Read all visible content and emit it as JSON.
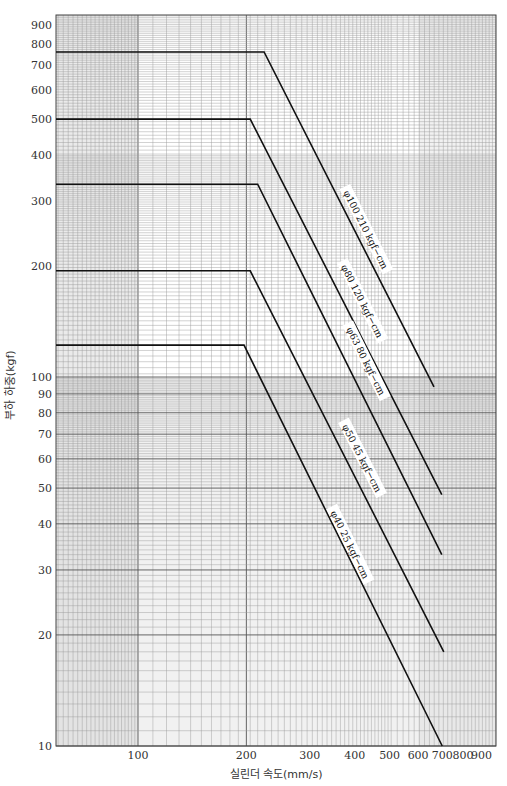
{
  "chart_data": {
    "type": "line",
    "title": "",
    "xlabel": "실린더 속도(mm/s)",
    "ylabel": "부하 하중(kgf)",
    "xscale": "log",
    "yscale": "log",
    "xlim": [
      59,
      985
    ],
    "ylim": [
      10,
      957
    ],
    "grid": true,
    "x_ticks": [
      100,
      200,
      300,
      400,
      500,
      600,
      700,
      800,
      900
    ],
    "x_tick_labels": [
      "100",
      "200",
      "300",
      "400",
      "500",
      "600",
      "700",
      "800",
      "900"
    ],
    "y_ticks": [
      10,
      20,
      30,
      40,
      50,
      60,
      70,
      80,
      90,
      100,
      200,
      300,
      400,
      500,
      600,
      700,
      800,
      900
    ],
    "y_tick_labels": [
      "10",
      "20",
      "30",
      "40",
      "50",
      "60",
      "70",
      "80",
      "90",
      "100",
      "200",
      "300",
      "400",
      "500",
      "600",
      "700",
      "800",
      "900"
    ],
    "series": [
      {
        "name": "φ100  210 kgf−cm",
        "x": [
          59,
          224,
          664
        ],
        "y": [
          760,
          760,
          94
        ]
      },
      {
        "name": "φ80  120 kgf−cm",
        "x": [
          59,
          205,
          698
        ],
        "y": [
          500,
          500,
          48
        ]
      },
      {
        "name": "φ63  80 kgf−cm",
        "x": [
          59,
          215,
          698
        ],
        "y": [
          333,
          333,
          33
        ]
      },
      {
        "name": "φ50  45 kgf−cm",
        "x": [
          59,
          205,
          707
        ],
        "y": [
          194,
          194,
          18
        ]
      },
      {
        "name": "φ40  25 kgf−cm",
        "x": [
          59,
          197,
          700
        ],
        "y": [
          122,
          122,
          10
        ]
      }
    ],
    "annotations": [
      {
        "text": "φ100  210 kgf−cm",
        "x": 410,
        "y": 250
      },
      {
        "text": "φ80  120 kgf−cm",
        "x": 400,
        "y": 160
      },
      {
        "text": "φ63  80 kgf−cm",
        "x": 410,
        "y": 110
      },
      {
        "text": "φ50  45 kgf−cm",
        "x": 400,
        "y": 60
      },
      {
        "text": "φ40  25 kgf−cm",
        "x": 370,
        "y": 35
      }
    ]
  },
  "colors": {
    "line": "#111111",
    "grid_minor": "#9a9a9a",
    "grid_major": "#555555",
    "shade": "#d8d8d8"
  }
}
